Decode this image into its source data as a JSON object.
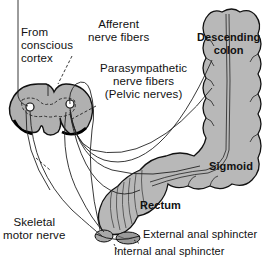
{
  "diagram": {
    "type": "anatomical",
    "colors": {
      "tissue_fill": "#b8b8b8",
      "outline": "#111111",
      "background": "#ffffff"
    },
    "labels": {
      "from_cortex": [
        "From",
        "conscious",
        "cortex"
      ],
      "afferent": [
        "Afferent",
        "nerve fibers"
      ],
      "parasympathetic": [
        "Parasympathetic",
        "nerve fibers"
      ],
      "pelvic_nerves": "(Pelvic nerves)",
      "descending_colon": [
        "Descending",
        "colon"
      ],
      "sigmoid": "Sigmoid",
      "rectum": "Rectum",
      "skeletal_motor": [
        "Skeletal",
        "motor nerve"
      ],
      "external_sphincter": "External anal sphincter",
      "internal_sphincter": "Internal anal sphincter"
    },
    "structures": [
      "spinal-cord-cross-section",
      "descending-colon",
      "sigmoid-colon",
      "rectum",
      "external-anal-sphincter",
      "internal-anal-sphincter"
    ]
  }
}
